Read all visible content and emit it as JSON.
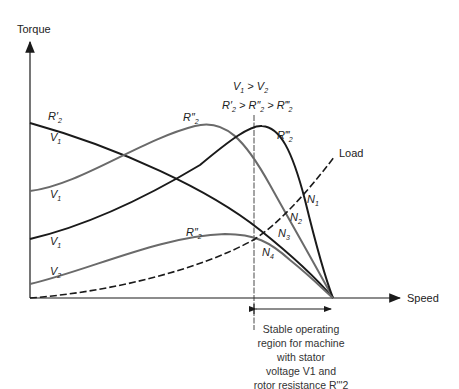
{
  "axes": {
    "y_label": "Torque",
    "x_label": "Speed"
  },
  "conditions": {
    "line1": "V1 > V2",
    "line2": "R'2 > R''2 > R'''2"
  },
  "curves": [
    {
      "id": "r2p_v1",
      "resistance": "R'2",
      "voltage": "V1",
      "color": "#1a1a1a",
      "style": "solid"
    },
    {
      "id": "r2pp_v1",
      "resistance": "R''2",
      "voltage": "V1",
      "color": "#6a6a6a",
      "style": "solid"
    },
    {
      "id": "r2ppp_v1",
      "resistance": "R'''2",
      "voltage": "V1",
      "color": "#1a1a1a",
      "style": "solid"
    },
    {
      "id": "r2pp_v2",
      "resistance": "R''2",
      "voltage": "V2",
      "color": "#6a6a6a",
      "style": "solid"
    },
    {
      "id": "load",
      "label": "Load",
      "color": "#1a1a1a",
      "style": "dashed"
    }
  ],
  "operating_points": [
    "N1",
    "N2",
    "N3",
    "N4"
  ],
  "labels": {
    "r2p": "R'",
    "r2pp": "R''",
    "r2ppp": "R'''",
    "sub2": "2",
    "v": "V",
    "sub1": "1",
    "n": "N",
    "load": "Load"
  },
  "caption": {
    "lines": [
      "Stable operating",
      "region for machine",
      "with stator",
      "voltage V1 and",
      "rotor resistance R'''2"
    ]
  }
}
